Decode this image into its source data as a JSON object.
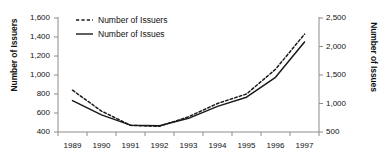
{
  "chart_data": {
    "type": "line",
    "title": "",
    "xlabel": "",
    "x": [
      "1989",
      "1990",
      "1991",
      "1992",
      "1993",
      "1994",
      "1995",
      "1996",
      "1997"
    ],
    "grid": false,
    "legend_position": "top-left",
    "left_axis": {
      "label": "Number of Issuers",
      "ticks": [
        "400",
        "600",
        "800",
        "1,000",
        "1,200",
        "1,400",
        "1,600"
      ],
      "tick_values": [
        400,
        600,
        800,
        1000,
        1200,
        1400,
        1600
      ],
      "ylim": [
        400,
        1600
      ]
    },
    "right_axis": {
      "label": "Number of Issues",
      "ticks": [
        "500",
        "1,000",
        "1,500",
        "2,000",
        "2,500"
      ],
      "tick_values": [
        500,
        1000,
        1500,
        2000,
        2500
      ],
      "ylim": [
        500,
        2500
      ]
    },
    "series": [
      {
        "name": "Number of Issuers",
        "style": "dashed",
        "axis": "left",
        "values": [
          840,
          620,
          470,
          460,
          560,
          700,
          800,
          1060,
          1430
        ]
      },
      {
        "name": "Number of Issues",
        "style": "solid",
        "axis": "right",
        "values": [
          1050,
          800,
          620,
          610,
          740,
          950,
          1110,
          1460,
          2080
        ]
      }
    ]
  },
  "legend": {
    "entries": [
      {
        "label": "Number of Issuers",
        "marker": "dashed-line-swatch"
      },
      {
        "label": "Number of Issues",
        "marker": "solid-line-swatch"
      }
    ]
  },
  "colors": {
    "line": "#1a1a1a",
    "axis": "#8c8c8c",
    "background": "#ffffff"
  }
}
